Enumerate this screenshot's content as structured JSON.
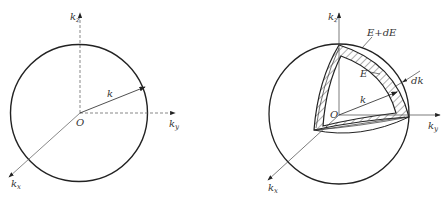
{
  "figure_left": {
    "axes": {
      "kz": {
        "main": "k",
        "sub": "z"
      },
      "ky": {
        "main": "k",
        "sub": "y"
      },
      "kx": {
        "main": "k",
        "sub": "x"
      }
    },
    "origin_label": "O",
    "radius_label": "k"
  },
  "figure_right": {
    "axes": {
      "kz": {
        "main": "k",
        "sub": "z"
      },
      "ky": {
        "main": "k",
        "sub": "y"
      },
      "kx": {
        "main": "k",
        "sub": "x"
      }
    },
    "origin_label": "O",
    "radius_label": "k",
    "outer_shell_label": "E+dE",
    "inner_shell_label": "E",
    "thickness_label": "dk"
  },
  "colors": {
    "stroke": "#222222",
    "axis": "#555555",
    "background": "#ffffff"
  }
}
